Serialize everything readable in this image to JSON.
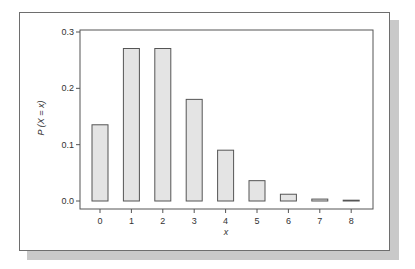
{
  "chart_data": {
    "type": "bar",
    "title": "",
    "xlabel": "x",
    "ylabel": "P (X = x)",
    "categories": [
      "0",
      "1",
      "2",
      "3",
      "4",
      "5",
      "6",
      "7",
      "8"
    ],
    "values": [
      0.1353,
      0.2707,
      0.2707,
      0.1804,
      0.0902,
      0.0361,
      0.012,
      0.0034,
      0.0009
    ],
    "ylim": [
      0,
      0.3
    ],
    "yticks": [
      "0.0",
      "0.1",
      "0.2",
      "0.3"
    ],
    "ytick_values": [
      0.0,
      0.1,
      0.2,
      0.3
    ],
    "grid": false,
    "legend": "none",
    "bar_fill": "#e4e4e4",
    "bar_stroke": "#555555"
  }
}
